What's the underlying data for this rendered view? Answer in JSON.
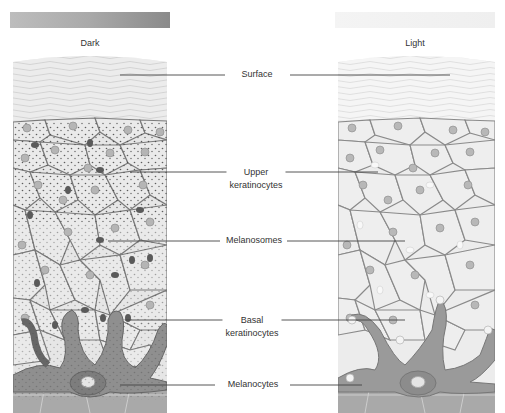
{
  "swatches": {
    "dark": {
      "label": "Dark",
      "color_start": "#bdbdbd",
      "color_end": "#8a8a8a"
    },
    "light": {
      "label": "Light",
      "color_start": "#f4f4f4",
      "color_end": "#efefef"
    }
  },
  "columns": {
    "dark": {
      "title": "Dark"
    },
    "light": {
      "title": "Light"
    }
  },
  "labels": {
    "surface": {
      "line1": "Surface"
    },
    "upper_keratinocytes": {
      "line1": "Upper",
      "line2": "keratinocytes"
    },
    "melanosomes": {
      "line1": "Melanosomes"
    },
    "basal_keratinocytes": {
      "line1": "Basal",
      "line2": "keratinocytes"
    },
    "melanocytes": {
      "line1": "Melanocytes"
    }
  },
  "colors": {
    "cell_fill": "#e9e9e9",
    "cell_border": "#7a7a7a",
    "nucleus": "#b5b5b5",
    "melanosome_dark": "#555555",
    "melanocyte_dark": "#8f8f8f",
    "melanocyte_light": "#9a9a9a",
    "dermis": "#a8a8a8",
    "leader_line": "#444444"
  }
}
